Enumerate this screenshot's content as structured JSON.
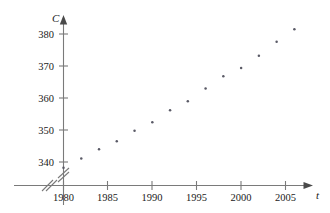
{
  "chart_data": {
    "type": "scatter",
    "title": "",
    "xlabel": "t",
    "ylabel": "C",
    "x": [
      1980,
      1982,
      1984,
      1986,
      1988,
      1990,
      1992,
      1994,
      1996,
      1998,
      2000,
      2002,
      2004,
      2006
    ],
    "values": [
      338.2,
      341.1,
      344.0,
      346.5,
      349.8,
      352.4,
      356.2,
      359.0,
      363.0,
      366.8,
      369.4,
      373.2,
      377.6,
      381.5
    ],
    "series": [
      {
        "name": "C",
        "values": [
          338.2,
          341.1,
          344.0,
          346.5,
          349.8,
          352.4,
          356.2,
          359.0,
          363.0,
          366.8,
          369.4,
          373.2,
          377.6,
          381.5
        ]
      }
    ],
    "xlim": [
      1978,
      2008
    ],
    "ylim": [
      335,
      384
    ],
    "xticks": [
      1980,
      1985,
      1990,
      1995,
      2000,
      2005
    ],
    "xtick_labels": [
      "1980",
      "1985",
      "1990",
      "1995",
      "2000",
      "2005"
    ],
    "yticks": [
      340,
      350,
      360,
      370,
      380
    ],
    "ytick_labels": [
      "340",
      "350",
      "360",
      "370",
      "380"
    ],
    "grid": false,
    "legend": "none",
    "axis_break_x": true,
    "axis_break_y": true,
    "marker": "dot",
    "point_color": "#5a5a66",
    "axis_color": "#7a7a7a"
  },
  "axes": {
    "y_label": "C",
    "x_label": "t"
  },
  "ticks": {
    "y": [
      "380",
      "370",
      "360",
      "350",
      "340"
    ],
    "x": [
      "1980",
      "1985",
      "1990",
      "1995",
      "2000",
      "2005"
    ]
  }
}
